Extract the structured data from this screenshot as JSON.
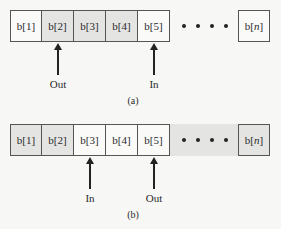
{
  "diagram_a": {
    "caption": "(a)",
    "cells": [
      {
        "label": "b[1]",
        "shaded": false
      },
      {
        "label": "b[2]",
        "shaded": true
      },
      {
        "label": "b[3]",
        "shaded": true
      },
      {
        "label": "b[4]",
        "shaded": true
      },
      {
        "label": "b[5]",
        "shaded": false
      }
    ],
    "ellipsis_shaded": false,
    "last_cell": {
      "prefix": "b[",
      "index": "n",
      "suffix": "]",
      "shaded": false
    },
    "pointers": [
      {
        "label": "Out",
        "cell_index": 1
      },
      {
        "label": "In",
        "cell_index": 4
      }
    ]
  },
  "diagram_b": {
    "caption": "(b)",
    "cells": [
      {
        "label": "b[1]",
        "shaded": true
      },
      {
        "label": "b[2]",
        "shaded": true
      },
      {
        "label": "b[3]",
        "shaded": false
      },
      {
        "label": "b[4]",
        "shaded": false
      },
      {
        "label": "b[5]",
        "shaded": false
      }
    ],
    "ellipsis_shaded": true,
    "last_cell": {
      "prefix": "b[",
      "index": "n",
      "suffix": "]",
      "shaded": true
    },
    "pointers": [
      {
        "label": "In",
        "cell_index": 2
      },
      {
        "label": "Out",
        "cell_index": 4
      }
    ]
  },
  "colors": {
    "shaded": "#e4e4e2",
    "white": "#fafaf9",
    "stroke": "#555555"
  }
}
